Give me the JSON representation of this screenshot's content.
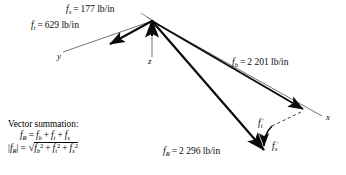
{
  "figure": {
    "type": "vector-diagram",
    "background": "#ffffff",
    "ink": "#0a0a0a"
  },
  "axes": [
    {
      "name": "y",
      "label": "y"
    },
    {
      "name": "z",
      "label": "z"
    },
    {
      "name": "x",
      "label": "x"
    }
  ],
  "vectors": {
    "fs": {
      "symbol": "f",
      "subscript": "s",
      "equals": "=",
      "value": "177",
      "unit": "lb/in",
      "full_label": "f_s = 177 lb/in"
    },
    "ft": {
      "symbol": "f",
      "subscript": "t",
      "equals": "=",
      "value": "629",
      "unit": "lb/in",
      "full_label": "f_t = 629 lb/in"
    },
    "fb": {
      "symbol": "f",
      "subscript": "b",
      "equals": "=",
      "value": "2 201",
      "unit": "lb/in",
      "full_label": "f_b = 2 201 lb/in"
    },
    "fR": {
      "symbol": "f",
      "subscript": "R",
      "equals": "=",
      "value": "2 296",
      "unit": "lb/in",
      "full_label": "f_R = 2 296 lb/in"
    },
    "ft_prime": {
      "symbol": "f",
      "subscript": "t",
      "prime": "′",
      "full_label": "f_t'"
    },
    "fs_prime": {
      "symbol": "f",
      "subscript": "s",
      "prime": "′",
      "full_label": "f_s'"
    }
  },
  "summary": {
    "title": "Vector summation:",
    "eq1": {
      "lhs_symbol": "f",
      "lhs_sub": "R",
      "equals": "=",
      "term1_symbol": "f",
      "term1_sub": "b",
      "plus1": "+",
      "term2_symbol": "f",
      "term2_sub": "t",
      "plus2": "+",
      "term3_symbol": "f",
      "term3_sub": "s",
      "plain": "f_R = f_b + f_t + f_s"
    },
    "eq2": {
      "bar_left": "|",
      "lhs_symbol": "f",
      "lhs_sub": "R",
      "bar_right": "|",
      "equals": "=",
      "radical": "√",
      "t1_symbol": "f",
      "t1_sub": "b",
      "t1_exp": "2",
      "plus1": "+",
      "t2_symbol": "f",
      "t2_sub": "t",
      "t2_exp": "2",
      "plus2": "+",
      "t3_symbol": "f",
      "t3_sub": "s",
      "t3_exp": "2",
      "plain": "|f_R| = sqrt(f_b^2 + f_t^2 + f_s^2)"
    }
  }
}
